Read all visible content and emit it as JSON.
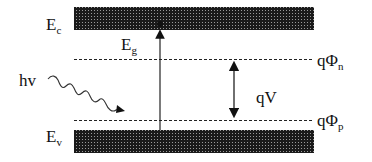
{
  "diagram": {
    "labels": {
      "conduction_band": "E",
      "conduction_band_sub": "c",
      "valence_band": "E",
      "valence_band_sub": "v",
      "bandgap": "E",
      "bandgap_sub": "g",
      "photon": "hv",
      "quasi_fermi_n": "qΦ",
      "quasi_fermi_n_sub": "n",
      "quasi_fermi_p": "qΦ",
      "quasi_fermi_p_sub": "p",
      "voltage": "qV"
    },
    "colors": {
      "band_fill": "#2a2a2a",
      "line": "#222222",
      "background": "#ffffff"
    }
  }
}
